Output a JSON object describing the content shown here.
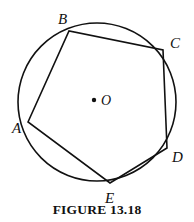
{
  "figure": {
    "caption": "FIGURE 13.18",
    "background_color": "#ffffff",
    "stroke_color": "#111111",
    "width": 194,
    "height": 222
  },
  "circle": {
    "name": "circumscribed-circle",
    "center_x": 97,
    "center_y": 102,
    "radius": 79,
    "stroke_width": 1.6
  },
  "center_point": {
    "label": "O",
    "dot_x": 94,
    "dot_y": 100,
    "dot_radius": 2.2,
    "label_x": 101,
    "label_y": 105
  },
  "polygon": {
    "name": "inscribed-pentagon-ABCDE",
    "stroke_width": 1.6,
    "vertices": [
      {
        "label": "A",
        "x": 28,
        "y": 122,
        "label_x": 12,
        "label_y": 133
      },
      {
        "label": "B",
        "x": 69,
        "y": 31,
        "label_x": 58,
        "label_y": 24
      },
      {
        "label": "C",
        "x": 163,
        "y": 50,
        "label_x": 170,
        "label_y": 48
      },
      {
        "label": "D",
        "x": 167,
        "y": 148,
        "label_x": 172,
        "label_y": 162
      },
      {
        "label": "E",
        "x": 110,
        "y": 183,
        "label_x": 105,
        "label_y": 203
      }
    ],
    "edges": [
      {
        "name": "chord-AB",
        "from": "A",
        "to": "B"
      },
      {
        "name": "chord-BC",
        "from": "B",
        "to": "C"
      },
      {
        "name": "chord-CD",
        "from": "C",
        "to": "D"
      },
      {
        "name": "chord-DE",
        "from": "D",
        "to": "E"
      },
      {
        "name": "chord-EA",
        "from": "E",
        "to": "A"
      }
    ]
  }
}
